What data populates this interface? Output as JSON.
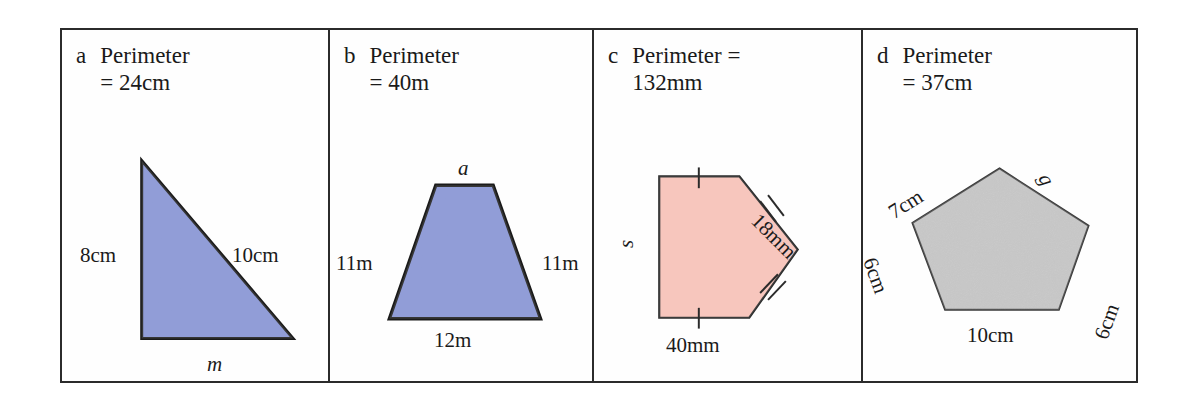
{
  "worksheet": {
    "title_prefix": "Perimeter",
    "panels": [
      {
        "id": "a",
        "letter": "a",
        "heading": "Perimeter\n= 24cm",
        "perimeter_value": "24cm",
        "shape": "right-triangle",
        "fill_color": "#8290d2",
        "stroke_color": "#1a1a1a",
        "labels": [
          {
            "name": "side-left-label",
            "text": "8cm",
            "orientation": "horizontal"
          },
          {
            "name": "side-hyp-label",
            "text": "10cm",
            "orientation": "horizontal"
          },
          {
            "name": "side-base-label",
            "text": "m",
            "orientation": "horizontal",
            "italic": true
          }
        ]
      },
      {
        "id": "b",
        "letter": "b",
        "heading": "Perimeter\n= 40m",
        "perimeter_value": "40m",
        "shape": "trapezoid",
        "fill_color": "#8290d2",
        "stroke_color": "#1a1a1a",
        "labels": [
          {
            "name": "side-top-label",
            "text": "a",
            "orientation": "horizontal",
            "italic": true
          },
          {
            "name": "side-left-label",
            "text": "11m",
            "orientation": "horizontal"
          },
          {
            "name": "side-right-label",
            "text": "11m",
            "orientation": "horizontal"
          },
          {
            "name": "side-bottom-label",
            "text": "12m",
            "orientation": "horizontal"
          }
        ]
      },
      {
        "id": "c",
        "letter": "c",
        "heading": "Perimeter =\n132mm",
        "perimeter_value": "132mm",
        "shape": "pentagon-arrow",
        "fill_color": "#f7c0b6",
        "stroke_color": "#1a1a1a",
        "tick_marks": [
          {
            "name": "tick-top-single",
            "count": 1
          },
          {
            "name": "tick-bottom-single",
            "count": 1
          },
          {
            "name": "tick-upper-right-double",
            "count": 2
          },
          {
            "name": "tick-lower-right-double",
            "count": 2
          }
        ],
        "labels": [
          {
            "name": "side-left-label",
            "text": "s",
            "orientation": "rotated-90",
            "italic": true
          },
          {
            "name": "side-upper-right-label",
            "text": "18mm",
            "orientation": "rotated-45"
          },
          {
            "name": "side-bottom-label",
            "text": "40mm",
            "orientation": "horizontal"
          }
        ]
      },
      {
        "id": "d",
        "letter": "d",
        "heading": "Perimeter\n= 37cm",
        "perimeter_value": "37cm",
        "shape": "pentagon",
        "fill_color": "#dedede",
        "stroke_color": "#3a3a3a",
        "labels": [
          {
            "name": "side-upper-left-label",
            "text": "7cm",
            "orientation": "rotated-minus-32"
          },
          {
            "name": "side-upper-right-label",
            "text": "g",
            "orientation": "rotated-62",
            "italic": true
          },
          {
            "name": "side-left-label",
            "text": "6cm",
            "orientation": "rotated-70"
          },
          {
            "name": "side-right-label",
            "text": "6cm",
            "orientation": "rotated-minus-70"
          },
          {
            "name": "side-bottom-label",
            "text": "10cm",
            "orientation": "horizontal"
          }
        ]
      }
    ]
  },
  "colors": {
    "blue_fill": "#8290d2",
    "pink_fill": "#f7c0b6",
    "grey_fill": "#dedede",
    "border": "#2b2b2b",
    "text": "#1a1a1a",
    "page_background": "#ffffff"
  }
}
